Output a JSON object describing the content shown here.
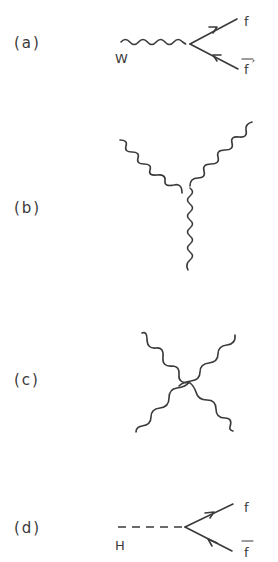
{
  "figure": {
    "panels": [
      {
        "id": "a",
        "label": "(a)",
        "description": "W boson decay vertex to fermion pair",
        "incoming": {
          "label": "W",
          "line": "wavy"
        },
        "outgoing": [
          {
            "label": "f",
            "line": "fermion",
            "arrow": "outward"
          },
          {
            "label": "f̄′",
            "base": "f",
            "overline": true,
            "prime": "′",
            "line": "fermion",
            "arrow": "inward"
          }
        ]
      },
      {
        "id": "b",
        "label": "(b)",
        "description": "Triple gauge boson vertex",
        "lines": [
          "wavy",
          "wavy",
          "wavy"
        ]
      },
      {
        "id": "c",
        "label": "(c)",
        "description": "Quartic gauge boson vertex",
        "lines": [
          "wavy",
          "wavy",
          "wavy",
          "wavy"
        ]
      },
      {
        "id": "d",
        "label": "(d)",
        "description": "Higgs decay vertex to fermion pair",
        "incoming": {
          "label": "H",
          "line": "dashed"
        },
        "outgoing": [
          {
            "label": "f",
            "line": "fermion",
            "arrow": "outward"
          },
          {
            "label": "f",
            "base": "f",
            "overline": true,
            "line": "fermion",
            "arrow": "inward"
          }
        ]
      }
    ]
  },
  "labels": {
    "a": "(a)",
    "b": "(b)",
    "c": "(c)",
    "d": "(d)",
    "W": "W",
    "H": "H",
    "f_a": "f",
    "fbar_a": "f",
    "prime_a": "′",
    "f_d": "f",
    "fbar_d": "f"
  },
  "colors": {
    "ink": "#3a3a3a",
    "background": "#ffffff"
  }
}
